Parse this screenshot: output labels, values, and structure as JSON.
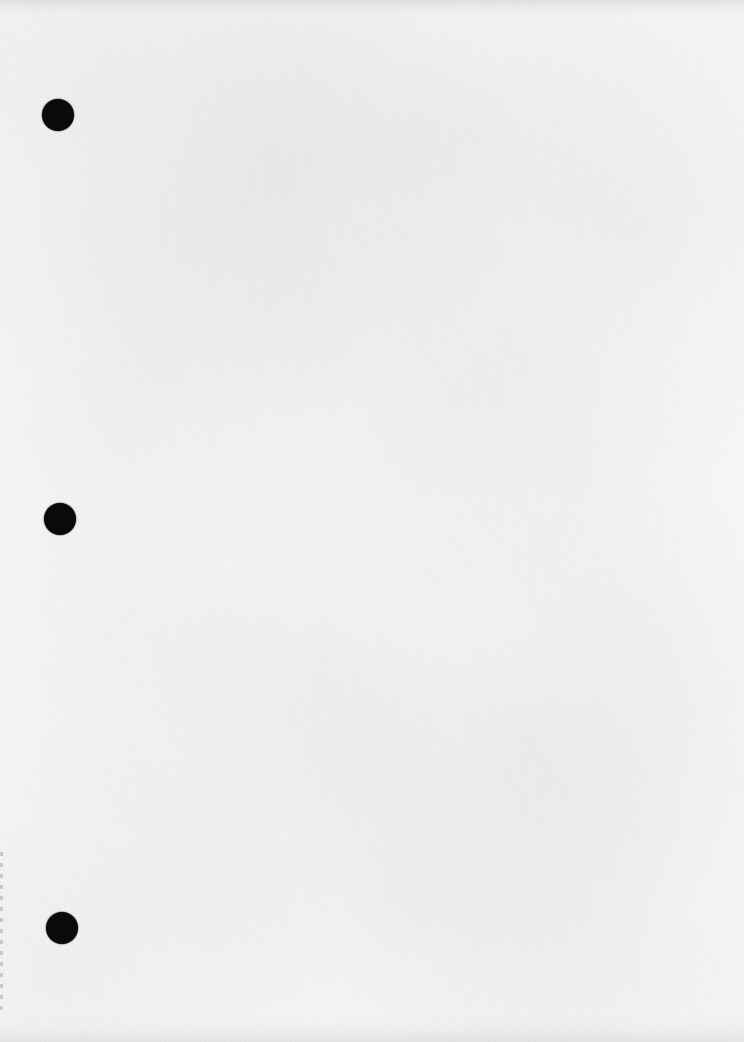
{
  "document": {
    "kind": "scanned-paper-sheet",
    "title": "Scanned blank page",
    "orientation": "portrait",
    "width_px": 744,
    "height_px": 1042,
    "content_text": "",
    "has_text": false,
    "background_color": "#fafafa",
    "paper_tone_color": "#f8f8f8",
    "ink_color": "#0a0a0a"
  },
  "punch_holes": {
    "count": 3,
    "shape": "circle",
    "color": "#0a0a0a",
    "items": [
      {
        "name": "punch-hole-top",
        "cx": 58,
        "cy": 115,
        "d": 32
      },
      {
        "name": "punch-hole-middle",
        "cx": 60,
        "cy": 519,
        "d": 32
      },
      {
        "name": "punch-hole-bottom",
        "cx": 62,
        "cy": 928,
        "d": 32
      }
    ]
  },
  "scan_artifacts": {
    "top_edge_band": {
      "name": "top-edge-shadow",
      "height_px": 16,
      "color": "#cdcdd0"
    },
    "bottom_edge_band": {
      "name": "bottom-edge-shadow",
      "height_px": 26,
      "color": "#d2d2d5"
    },
    "left_edge_line": {
      "name": "left-scan-edge-line",
      "x_px": 0,
      "top_px": 852,
      "height_px": 160,
      "color": "#8c8c91"
    },
    "vignette": {
      "name": "scan-vignette",
      "color": "#e1e1e5"
    }
  }
}
